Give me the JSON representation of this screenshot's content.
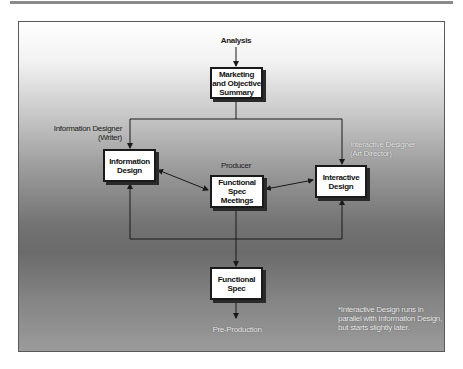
{
  "diagram": {
    "start_label": "Analysis",
    "end_label": "Pre-Production",
    "nodes": {
      "marketing": "Marketing\nand Objective\nSummary",
      "information_design": "Information\nDesign",
      "functional_spec_meetings": "Functional Spec\nMeetings",
      "interactive_design": "Interactive\nDesign",
      "functional_spec": "Functional\nSpec"
    },
    "roles": {
      "information_designer": "Information Designer\n(Writer)",
      "producer": "Producer",
      "interactive_designer": "Interactive Designer\n(Art Director)"
    },
    "footnote": "*Interactive Design runs in\nparallel with Information Design,\nbut starts slightly later."
  }
}
